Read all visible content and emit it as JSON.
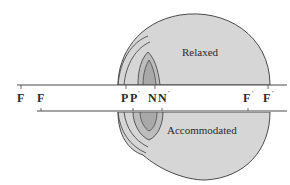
{
  "diagram": {
    "colors": {
      "eye_fill": "#d6d6d6",
      "lens_fill": "#bdbdbd",
      "outline": "#4a4a4a",
      "text": "#2a2a2a"
    },
    "regions": {
      "upper": "Relaxed",
      "lower": "Accommodated"
    },
    "cardinal_points": [
      {
        "id": "F-accommodated",
        "base": "F",
        "prime": false,
        "state": "accommodated"
      },
      {
        "id": "F-relaxed",
        "base": "F",
        "prime": false,
        "state": "relaxed"
      },
      {
        "id": "P",
        "base": "P",
        "prime": false
      },
      {
        "id": "P-prime",
        "base": "P",
        "prime": true
      },
      {
        "id": "N",
        "base": "N",
        "prime": false
      },
      {
        "id": "N-prime",
        "base": "N",
        "prime": true
      },
      {
        "id": "F-prime-accommodated",
        "base": "F",
        "prime": true,
        "state": "accommodated"
      },
      {
        "id": "F-prime-relaxed",
        "base": "F",
        "prime": true,
        "state": "relaxed"
      }
    ],
    "prime_mark": "'"
  }
}
